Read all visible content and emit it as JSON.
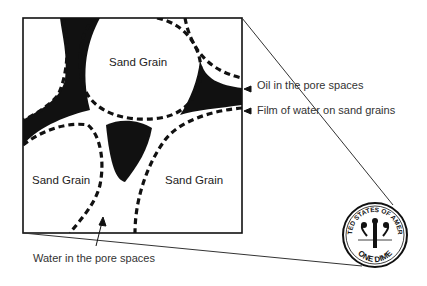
{
  "diagram": {
    "labels": {
      "grain_top": "Sand Grain",
      "grain_left": "Sand Grain",
      "grain_right": "Sand Grain",
      "oil": "Oil in the pore spaces",
      "film": "Film of water on sand grains",
      "water": "Water in the pore spaces"
    },
    "dime": {
      "top_text": "UNITED STATES OF AMERICA",
      "bottom_text": "ONE DIME"
    },
    "colors": {
      "ink": "#111111",
      "text": "#333333",
      "background": "#ffffff"
    }
  }
}
